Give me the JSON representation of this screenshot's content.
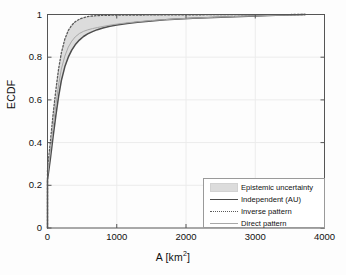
{
  "chart_data": {
    "type": "line",
    "title": "",
    "xlabel": "A [km2]",
    "xlabel_base": "A [km",
    "xlabel_sup": "2",
    "xlabel_tail": "]",
    "ylabel": "ECDF",
    "xlim": [
      0,
      4000
    ],
    "ylim": [
      0,
      1
    ],
    "xticks": [
      0,
      1000,
      2000,
      3000,
      4000
    ],
    "xtick_labels": [
      "0",
      "1000",
      "2000",
      "3000",
      "4000"
    ],
    "yticks": [
      0,
      0.2,
      0.4,
      0.6,
      0.8,
      1
    ],
    "ytick_labels": [
      "0",
      "0.2",
      "0.4",
      "0.6",
      "0.8",
      "1"
    ],
    "grid": true,
    "legend_position": "lower right",
    "series": [
      {
        "name": "Independent (AU)",
        "style": "solid",
        "color": "#4d4d4d",
        "x": [
          0,
          0,
          40,
          80,
          120,
          160,
          200,
          250,
          300,
          350,
          400,
          460,
          520,
          580,
          650,
          720,
          800,
          900,
          1000,
          1150,
          1300,
          1500,
          1700,
          1900,
          2100,
          2400,
          2700,
          3000,
          3300,
          3600,
          3720
        ],
        "y": [
          0,
          0.225,
          0.32,
          0.425,
          0.525,
          0.615,
          0.69,
          0.755,
          0.8,
          0.833,
          0.858,
          0.88,
          0.897,
          0.909,
          0.92,
          0.929,
          0.937,
          0.945,
          0.951,
          0.958,
          0.964,
          0.97,
          0.975,
          0.979,
          0.982,
          0.986,
          0.99,
          0.993,
          0.996,
          0.999,
          1.0
        ]
      },
      {
        "name": "Inverse pattern",
        "style": "dotted",
        "color": "#5a5a5a",
        "x": [
          0,
          0,
          40,
          80,
          120,
          160,
          200,
          250,
          300,
          350,
          400,
          460,
          520,
          580,
          650,
          720,
          800,
          900,
          1000,
          1150,
          1300,
          1500,
          1700,
          1900,
          2100,
          2400,
          2700,
          3000,
          3300,
          3600,
          3720
        ],
        "y": [
          0,
          0.275,
          0.4,
          0.53,
          0.645,
          0.745,
          0.82,
          0.885,
          0.925,
          0.95,
          0.966,
          0.978,
          0.985,
          0.99,
          0.993,
          0.995,
          0.996,
          0.9965,
          0.997,
          0.9973,
          0.9976,
          0.998,
          0.9983,
          0.9986,
          0.9988,
          0.9991,
          0.9994,
          0.9996,
          0.9998,
          0.9999,
          1.0
        ]
      },
      {
        "name": "Direct pattern",
        "style": "solid-light",
        "color": "#a8a8a8",
        "x": [
          0,
          0,
          40,
          80,
          120,
          160,
          200,
          250,
          300,
          350,
          400,
          460,
          520,
          580,
          650,
          720,
          800,
          900,
          1000,
          1150,
          1300,
          1500,
          1700,
          1900,
          2100,
          2400,
          2700,
          3000,
          3300,
          3600,
          3720
        ],
        "y": [
          0,
          0.245,
          0.355,
          0.47,
          0.575,
          0.67,
          0.745,
          0.805,
          0.847,
          0.875,
          0.895,
          0.911,
          0.921,
          0.928,
          0.934,
          0.939,
          0.944,
          0.95,
          0.955,
          0.961,
          0.966,
          0.972,
          0.976,
          0.98,
          0.983,
          0.987,
          0.9905,
          0.9935,
          0.9965,
          0.999,
          1.0
        ]
      }
    ],
    "band": {
      "name": "Epistemic uncertainty",
      "fill": "#dcdcdc",
      "upper_series": "Inverse pattern",
      "lower_series": "Independent (AU)"
    }
  },
  "legend": {
    "items": [
      {
        "label": "Epistemic uncertainty",
        "key": "patch"
      },
      {
        "label": "Independent (AU)",
        "key": "solid"
      },
      {
        "label": "Inverse pattern",
        "key": "dotted"
      },
      {
        "label": "Direct pattern",
        "key": "light"
      }
    ]
  },
  "colors": {
    "band_fill": "#dcdcdc",
    "independent": "#4d4d4d",
    "inverse": "#5a5a5a",
    "direct": "#a8a8a8",
    "axis": "#555555",
    "grid": "#ececec"
  }
}
